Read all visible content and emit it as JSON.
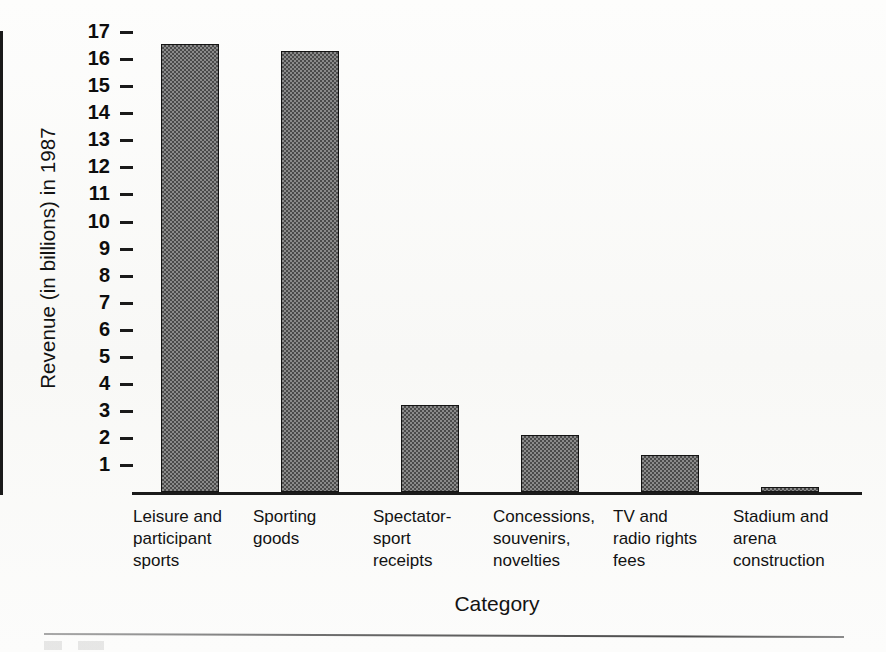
{
  "chart_data": {
    "type": "bar",
    "title": "",
    "xlabel": "Category",
    "ylabel": "Revenue (in billions) in 1987",
    "categories": [
      "Leisure and participant sports",
      "Sporting goods",
      "Spectator-sport receipts",
      "Concessions, souvenirs, novelties",
      "TV and radio rights fees",
      "Stadium and arena construction"
    ],
    "category_lines": [
      [
        "Leisure and",
        "participant",
        "sports"
      ],
      [
        "Sporting",
        "goods"
      ],
      [
        "Spectator-",
        "sport",
        "receipts"
      ],
      [
        "Concessions,",
        "souvenirs,",
        "novelties"
      ],
      [
        "TV and",
        "radio rights",
        "fees"
      ],
      [
        "Stadium and",
        "arena",
        "construction"
      ]
    ],
    "values": [
      16.55,
      16.3,
      3.2,
      2.1,
      1.35,
      0.2
    ],
    "ylim": [
      0,
      17
    ],
    "ytick_values": [
      17,
      16,
      15,
      14,
      13,
      12,
      11,
      10,
      9,
      8,
      7,
      6,
      5,
      4,
      3,
      2,
      1
    ],
    "ytick_labels": [
      "17",
      "16",
      "15",
      "14",
      "13",
      "12",
      "11",
      "10",
      "9",
      "8",
      "7",
      "6",
      "5",
      "4",
      "3",
      "2",
      "1"
    ],
    "grid": false,
    "legend": null,
    "bar_fill_color": "#808080",
    "bar_edge_color": "#141414",
    "axis_color": "#1a1a1a",
    "background_color": "#fbfbfa"
  },
  "axes": {
    "y_title": "Revenue (in billions) in 1987",
    "x_title": "Category"
  }
}
